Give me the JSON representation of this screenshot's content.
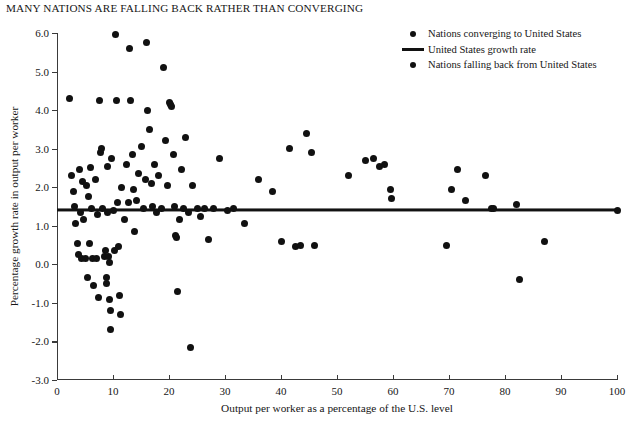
{
  "chart_data": {
    "type": "scatter",
    "title": "MANY NATIONS ARE FALLING BACK RATHER THAN CONVERGING",
    "xlabel": "Output per worker as a percentage of the U.S. level",
    "ylabel": "Percentage growth rate in output per worker",
    "xlim": [
      0,
      100
    ],
    "ylim": [
      -3.0,
      6.0
    ],
    "xticks": [
      0,
      10,
      20,
      30,
      40,
      50,
      60,
      70,
      80,
      90,
      100
    ],
    "yticks": [
      "6.0",
      "5.0",
      "4.0",
      "3.0",
      "2.0",
      "1.0",
      "0.0",
      "-1.0",
      "-2.0",
      "-3.0"
    ],
    "ytick_values": [
      6.0,
      5.0,
      4.0,
      3.0,
      2.0,
      1.0,
      0.0,
      -1.0,
      -2.0,
      -3.0
    ],
    "grid": false,
    "legend_position": "top-right",
    "legend": [
      {
        "key": "dot",
        "label": "Nations converging to United States"
      },
      {
        "key": "line",
        "label": "United States growth rate"
      },
      {
        "key": "dot",
        "label": "Nations falling back from United States"
      }
    ],
    "reference_line": {
      "name": "United States growth rate",
      "y": 1.4,
      "color": "#121212"
    },
    "marker_color": "#111111",
    "series": [
      {
        "name": "Nations",
        "points": [
          [
            2.2,
            4.3
          ],
          [
            2.6,
            2.3
          ],
          [
            3.0,
            1.9
          ],
          [
            3.2,
            1.5
          ],
          [
            3.3,
            1.05
          ],
          [
            3.6,
            0.55
          ],
          [
            3.8,
            0.25
          ],
          [
            4.0,
            2.45
          ],
          [
            4.2,
            1.35
          ],
          [
            4.4,
            0.15
          ],
          [
            4.6,
            2.15
          ],
          [
            4.8,
            1.15
          ],
          [
            5.0,
            0.15
          ],
          [
            5.2,
            2.05
          ],
          [
            5.4,
            -0.35
          ],
          [
            5.6,
            1.75
          ],
          [
            5.8,
            0.55
          ],
          [
            6.0,
            2.5
          ],
          [
            6.2,
            1.45
          ],
          [
            6.4,
            0.15
          ],
          [
            6.6,
            -0.55
          ],
          [
            6.8,
            2.2
          ],
          [
            7.0,
            0.15
          ],
          [
            7.2,
            1.3
          ],
          [
            7.4,
            -0.85
          ],
          [
            7.6,
            4.25
          ],
          [
            7.8,
            2.9
          ],
          [
            8.0,
            3.0
          ],
          [
            8.2,
            1.45
          ],
          [
            8.4,
            0.2
          ],
          [
            8.6,
            0.35
          ],
          [
            8.8,
            -0.35
          ],
          [
            8.9,
            -0.5
          ],
          [
            9.0,
            2.55
          ],
          [
            9.1,
            1.35
          ],
          [
            9.2,
            0.2
          ],
          [
            9.3,
            0.05
          ],
          [
            9.4,
            -0.9
          ],
          [
            9.5,
            -1.2
          ],
          [
            9.6,
            -1.7
          ],
          [
            9.8,
            2.75
          ],
          [
            10.0,
            1.4
          ],
          [
            10.2,
            0.35
          ],
          [
            10.4,
            5.95
          ],
          [
            10.6,
            4.25
          ],
          [
            10.8,
            1.6
          ],
          [
            11.0,
            0.45
          ],
          [
            11.2,
            -0.8
          ],
          [
            11.4,
            -1.3
          ],
          [
            11.6,
            2.0
          ],
          [
            12.0,
            1.15
          ],
          [
            12.4,
            2.6
          ],
          [
            12.8,
            1.6
          ],
          [
            13.0,
            5.6
          ],
          [
            13.2,
            4.25
          ],
          [
            13.4,
            2.85
          ],
          [
            13.6,
            1.95
          ],
          [
            13.8,
            0.85
          ],
          [
            14.2,
            1.65
          ],
          [
            14.6,
            2.35
          ],
          [
            15.0,
            3.05
          ],
          [
            15.4,
            1.45
          ],
          [
            15.8,
            2.2
          ],
          [
            16.0,
            5.75
          ],
          [
            16.2,
            4.0
          ],
          [
            16.5,
            3.5
          ],
          [
            16.8,
            2.1
          ],
          [
            17.0,
            1.5
          ],
          [
            17.4,
            2.6
          ],
          [
            17.8,
            1.35
          ],
          [
            18.2,
            2.3
          ],
          [
            18.6,
            1.45
          ],
          [
            19.0,
            5.1
          ],
          [
            19.4,
            3.2
          ],
          [
            19.8,
            2.05
          ],
          [
            20.0,
            4.2
          ],
          [
            20.3,
            4.15
          ],
          [
            20.5,
            4.1
          ],
          [
            20.8,
            2.85
          ],
          [
            21.0,
            1.5
          ],
          [
            21.2,
            0.75
          ],
          [
            21.4,
            0.7
          ],
          [
            21.6,
            -0.7
          ],
          [
            21.8,
            1.15
          ],
          [
            22.2,
            2.45
          ],
          [
            22.6,
            1.45
          ],
          [
            23.0,
            3.3
          ],
          [
            23.4,
            1.35
          ],
          [
            23.8,
            -2.15
          ],
          [
            24.2,
            2.05
          ],
          [
            25.0,
            1.45
          ],
          [
            25.6,
            1.25
          ],
          [
            26.4,
            1.45
          ],
          [
            27.0,
            0.65
          ],
          [
            28.0,
            1.45
          ],
          [
            29.0,
            2.75
          ],
          [
            30.5,
            1.4
          ],
          [
            31.5,
            1.45
          ],
          [
            33.5,
            1.05
          ],
          [
            36.0,
            2.2
          ],
          [
            38.5,
            1.9
          ],
          [
            40.0,
            0.6
          ],
          [
            41.5,
            3.0
          ],
          [
            42.5,
            0.45
          ],
          [
            43.5,
            0.5
          ],
          [
            44.5,
            3.4
          ],
          [
            45.5,
            2.9
          ],
          [
            46.0,
            0.5
          ],
          [
            52.0,
            2.3
          ],
          [
            55.0,
            2.7
          ],
          [
            56.5,
            2.75
          ],
          [
            57.5,
            2.55
          ],
          [
            58.5,
            2.6
          ],
          [
            59.5,
            1.95
          ],
          [
            59.8,
            1.7
          ],
          [
            69.5,
            0.5
          ],
          [
            70.5,
            1.95
          ],
          [
            71.5,
            2.45
          ],
          [
            73.0,
            1.65
          ],
          [
            76.5,
            2.3
          ],
          [
            77.5,
            1.45
          ],
          [
            78.0,
            1.45
          ],
          [
            82.0,
            1.55
          ],
          [
            82.5,
            -0.4
          ],
          [
            87.0,
            0.6
          ],
          [
            100.0,
            1.4
          ]
        ]
      }
    ]
  }
}
